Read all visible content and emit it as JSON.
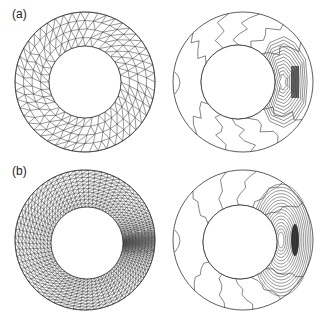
{
  "figure": {
    "panels": [
      {
        "id": "a",
        "label": "(a)",
        "label_pos": [
          12,
          7
        ]
      },
      {
        "id": "b",
        "label": "(b)",
        "label_pos": [
          12,
          164
        ]
      }
    ],
    "annuli": [
      {
        "name": "mesh-a",
        "kind": "uniform-mesh",
        "cx": 85,
        "cy": 82,
        "r_out": 70,
        "r_in": 36,
        "in_cx": 85,
        "in_cy": 82
      },
      {
        "name": "contour-a",
        "kind": "contour-coarse",
        "cx": 243,
        "cy": 82,
        "r_out": 70,
        "r_in": 37,
        "in_cx": 238,
        "in_cy": 82
      },
      {
        "name": "mesh-b",
        "kind": "adaptive-mesh",
        "cx": 85,
        "cy": 240,
        "r_out": 70,
        "r_in": 36,
        "in_cx": 87,
        "in_cy": 243
      },
      {
        "name": "contour-b",
        "kind": "contour-fine",
        "cx": 243,
        "cy": 240,
        "r_out": 70,
        "r_in": 37,
        "in_cx": 240,
        "in_cy": 242
      }
    ],
    "colors": {
      "line": "#333333",
      "dense": "#111111",
      "background": "#ffffff"
    }
  }
}
